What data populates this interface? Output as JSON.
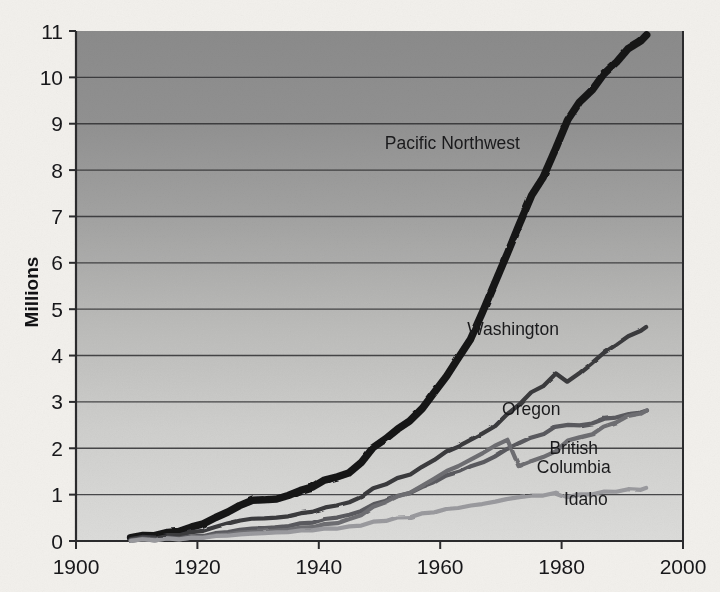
{
  "chart_data": {
    "type": "line",
    "title": "",
    "subtitle": "",
    "xlabel": "",
    "ylabel": "Millions",
    "xlim": [
      1900,
      2000
    ],
    "ylim": [
      0,
      11
    ],
    "grid": "horizontal",
    "legend_position": "inline-labels",
    "x_ticks": [
      "1900",
      "1920",
      "1940",
      "1960",
      "1980",
      "2000"
    ],
    "x_tick_values": [
      1900,
      1920,
      1940,
      1960,
      1980,
      2000
    ],
    "y_ticks": [
      "0",
      "1",
      "2",
      "3",
      "4",
      "5",
      "6",
      "7",
      "8",
      "9",
      "10",
      "11"
    ],
    "y_tick_values": [
      0,
      1,
      2,
      3,
      4,
      5,
      6,
      7,
      8,
      9,
      10,
      11
    ],
    "x": [
      1909,
      1911,
      1913,
      1915,
      1917,
      1919,
      1921,
      1923,
      1925,
      1927,
      1929,
      1931,
      1933,
      1935,
      1937,
      1939,
      1941,
      1943,
      1945,
      1947,
      1949,
      1951,
      1953,
      1955,
      1957,
      1959,
      1961,
      1963,
      1965,
      1967,
      1969,
      1971,
      1973,
      1975,
      1977,
      1979,
      1981,
      1983,
      1985,
      1987,
      1989,
      1991,
      1993,
      1994
    ],
    "series": [
      {
        "name": "Pacific Northwest",
        "color": "#161618",
        "width": 7.5,
        "label_x": 1962,
        "label_y": 8.45,
        "values": [
          0.09,
          0.1,
          0.13,
          0.17,
          0.22,
          0.29,
          0.38,
          0.5,
          0.63,
          0.76,
          0.88,
          0.89,
          0.9,
          0.99,
          1.08,
          1.18,
          1.3,
          1.4,
          1.45,
          1.72,
          2.0,
          2.22,
          2.4,
          2.6,
          2.85,
          3.2,
          3.55,
          3.95,
          4.35,
          4.95,
          5.55,
          6.2,
          6.8,
          7.45,
          7.85,
          8.45,
          9.1,
          9.45,
          9.75,
          10.05,
          10.35,
          10.6,
          10.8,
          10.9
        ]
      },
      {
        "name": "Washington",
        "color": "#3a3a3e",
        "width": 4.2,
        "label_x": 1972,
        "label_y": 4.45,
        "values": [
          0.06,
          0.07,
          0.09,
          0.11,
          0.14,
          0.18,
          0.23,
          0.3,
          0.38,
          0.44,
          0.48,
          0.49,
          0.5,
          0.54,
          0.59,
          0.64,
          0.71,
          0.78,
          0.82,
          0.97,
          1.12,
          1.24,
          1.34,
          1.45,
          1.58,
          1.76,
          1.92,
          2.05,
          2.18,
          2.32,
          2.48,
          2.72,
          2.95,
          3.2,
          3.35,
          3.6,
          3.45,
          3.62,
          3.85,
          4.05,
          4.25,
          4.4,
          4.55,
          4.6
        ]
      },
      {
        "name": "Oregon",
        "color": "#5a5a5e",
        "width": 4.2,
        "label_x": 1975,
        "label_y": 2.72,
        "values": [
          0.03,
          0.04,
          0.05,
          0.06,
          0.07,
          0.09,
          0.12,
          0.16,
          0.2,
          0.24,
          0.27,
          0.28,
          0.29,
          0.33,
          0.37,
          0.41,
          0.46,
          0.52,
          0.55,
          0.66,
          0.78,
          0.88,
          0.96,
          1.05,
          1.15,
          1.28,
          1.4,
          1.5,
          1.6,
          1.7,
          1.82,
          1.98,
          2.12,
          2.22,
          2.32,
          2.45,
          2.52,
          2.48,
          2.55,
          2.62,
          2.68,
          2.72,
          2.78,
          2.8
        ]
      },
      {
        "name": "British Columbia",
        "color": "#6e6e72",
        "width": 4.2,
        "label_x": 1982,
        "label_y": 1.88,
        "values": [
          0.02,
          0.02,
          0.03,
          0.04,
          0.05,
          0.06,
          0.09,
          0.12,
          0.15,
          0.18,
          0.2,
          0.21,
          0.22,
          0.25,
          0.28,
          0.31,
          0.35,
          0.4,
          0.45,
          0.58,
          0.72,
          0.85,
          0.95,
          1.05,
          1.18,
          1.35,
          1.5,
          1.62,
          1.75,
          1.9,
          2.05,
          2.18,
          1.62,
          1.72,
          1.82,
          1.92,
          2.18,
          2.22,
          2.32,
          2.45,
          2.58,
          2.68,
          2.76,
          2.8
        ]
      },
      {
        "name": "Idaho",
        "color": "#9a9a9e",
        "width": 4.2,
        "label_x": 1984,
        "label_y": 0.78,
        "values": [
          0.02,
          0.02,
          0.03,
          0.04,
          0.05,
          0.06,
          0.08,
          0.1,
          0.12,
          0.14,
          0.16,
          0.17,
          0.18,
          0.2,
          0.22,
          0.24,
          0.26,
          0.28,
          0.3,
          0.35,
          0.4,
          0.45,
          0.49,
          0.53,
          0.58,
          0.63,
          0.68,
          0.72,
          0.76,
          0.8,
          0.85,
          0.9,
          0.95,
          0.97,
          0.99,
          1.03,
          0.96,
          0.99,
          1.02,
          1.05,
          1.08,
          1.1,
          1.12,
          1.13
        ]
      }
    ]
  },
  "style": {
    "page_background": "#f2f0ec",
    "plot_top_fill": "#8e8e8e",
    "plot_bottom_fill": "#d9d9d7",
    "gridline_color": "#2e2e30",
    "axis_color": "#2b2b2d",
    "text_color": "#17171a"
  }
}
